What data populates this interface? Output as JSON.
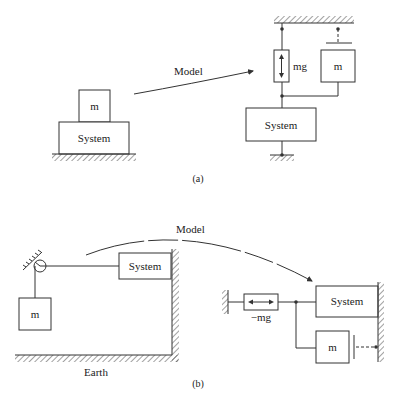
{
  "panel_a": {
    "caption": "(a)",
    "arrow_label": "Model",
    "left": {
      "mass_label": "m",
      "system_label": "System"
    },
    "right": {
      "source_label": "mg",
      "mass_label": "m",
      "system_label": "System"
    }
  },
  "panel_b": {
    "caption": "(b)",
    "arrow_label": "Model",
    "left": {
      "mass_label": "m",
      "system_label": "System",
      "ground_label": "Earth"
    },
    "right": {
      "source_label": "−mg",
      "mass_label": "m",
      "system_label": "System"
    }
  },
  "colors": {
    "line": "#333333",
    "background": "#ffffff"
  }
}
